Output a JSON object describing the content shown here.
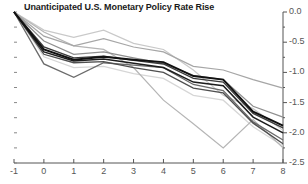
{
  "chart": {
    "title": "Unanticipated U.S. Monetary Policy Rate Rise",
    "axis_color": "#555555",
    "title_color": "#1a1a1a"
  },
  "chart_data": {
    "type": "line",
    "title": "Unanticipated U.S. Monetary Policy Rate Rise",
    "xlabel": "",
    "ylabel": "",
    "xlim": [
      -1,
      8
    ],
    "ylim": [
      -2.5,
      0.0
    ],
    "grid": false,
    "legend": "none",
    "y_axis_position": "right",
    "x": [
      -1,
      0,
      1,
      2,
      3,
      4,
      5,
      6,
      7,
      8
    ],
    "xticks": [
      "-1",
      "0",
      "1",
      "2",
      "3",
      "4",
      "5",
      "6",
      "7",
      "8"
    ],
    "yticks": [
      "0.0",
      "-0.5",
      "-1.0",
      "-1.5",
      "-2.0",
      "-2.5"
    ],
    "ytick_values": [
      0.0,
      -0.5,
      -1.0,
      -1.5,
      -2.0,
      -2.5
    ],
    "yminor_values": [
      -0.25,
      -0.75,
      -1.25,
      -1.75,
      -2.25
    ],
    "series": [
      {
        "name": "series-1-black-bold",
        "color": "#111111",
        "width": 1.9,
        "values": [
          0.0,
          -0.62,
          -0.79,
          -0.74,
          -0.79,
          -0.83,
          -1.06,
          -1.12,
          -1.65,
          -1.88
        ]
      },
      {
        "name": "series-2-black",
        "color": "#1c1c1c",
        "width": 1.5,
        "values": [
          0.0,
          -0.66,
          -0.81,
          -0.78,
          -0.85,
          -0.92,
          -1.16,
          -1.22,
          -1.74,
          -2.0
        ]
      },
      {
        "name": "series-3-darkgray",
        "color": "#3a3a3a",
        "width": 1.4,
        "values": [
          0.0,
          -0.58,
          -0.76,
          -0.73,
          -0.8,
          -0.86,
          -1.1,
          -1.16,
          -1.68,
          -1.92
        ]
      },
      {
        "name": "series-4-midgray",
        "color": "#4f4f4f",
        "width": 1.3,
        "values": [
          0.0,
          -0.7,
          -0.84,
          -0.82,
          -0.92,
          -1.0,
          -1.26,
          -1.34,
          -1.84,
          -2.18
        ]
      },
      {
        "name": "series-5-gray-dip",
        "color": "#6b6b6b",
        "width": 1.3,
        "values": [
          0.0,
          -0.86,
          -1.08,
          -0.84,
          -0.88,
          -0.92,
          -1.2,
          -1.3,
          -1.82,
          -2.12
        ]
      },
      {
        "name": "series-6-lightgray",
        "color": "#8f8f8f",
        "width": 1.2,
        "values": [
          0.0,
          -0.48,
          -0.7,
          -0.66,
          -0.76,
          -0.85,
          -1.05,
          -1.12,
          -1.56,
          -1.74
        ]
      },
      {
        "name": "series-7-lightgray-high",
        "color": "#a6a6a6",
        "width": 1.2,
        "values": [
          0.0,
          -0.4,
          -0.56,
          -0.44,
          -0.58,
          -0.66,
          -0.9,
          -0.96,
          -1.12,
          -1.26
        ]
      },
      {
        "name": "series-8-palegray-trough",
        "color": "#b5b5b5",
        "width": 1.2,
        "values": [
          0.0,
          -0.33,
          -0.56,
          -0.62,
          -0.92,
          -1.46,
          -1.85,
          -2.25,
          -1.78,
          -2.25
        ]
      },
      {
        "name": "series-9-palest",
        "color": "#c9c9c9",
        "width": 1.2,
        "values": [
          0.0,
          -0.3,
          -0.42,
          -0.3,
          -0.52,
          -0.62,
          -0.96,
          -1.38,
          -1.6,
          -1.96
        ]
      },
      {
        "name": "series-10-faint",
        "color": "#d6d6d6",
        "width": 1.2,
        "values": [
          0.0,
          -0.74,
          -0.92,
          -0.9,
          -1.02,
          -1.1,
          -1.38,
          -1.46,
          -1.9,
          -2.22
        ]
      }
    ]
  }
}
